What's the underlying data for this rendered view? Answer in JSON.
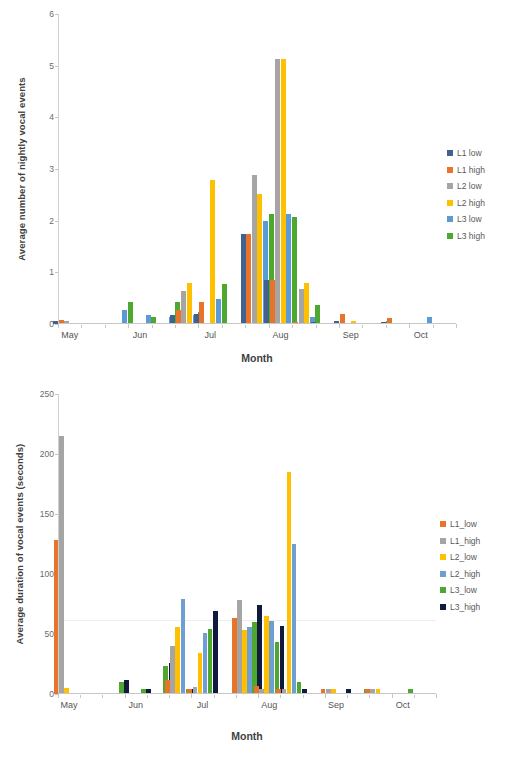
{
  "chart_data": [
    {
      "id": "chart1",
      "type": "bar",
      "title": "",
      "xlabel": "Month",
      "ylabel": "Average number of nightly vocal events",
      "ylim": [
        0,
        6
      ],
      "yticks": [
        0,
        1,
        2,
        3,
        4,
        5,
        6
      ],
      "grid": false,
      "legend_position": "right",
      "month_labels": [
        "May",
        "Jun",
        "Jul",
        "Aug",
        "Sep",
        "Oct"
      ],
      "month_label_slots": [
        0,
        3,
        6,
        9,
        12,
        15
      ],
      "categories": [
        "1",
        "2",
        "3",
        "4",
        "5",
        "6",
        "7",
        "8",
        "9",
        "10",
        "11",
        "12",
        "13",
        "14",
        "15",
        "16",
        "17"
      ],
      "series": [
        {
          "name": "L1 low",
          "color": "#41618f",
          "values": [
            0.06,
            0,
            0,
            0,
            0,
            0.17,
            0.2,
            0,
            1.75,
            0.85,
            0,
            0.04,
            0.06,
            0,
            0.04,
            0,
            0
          ]
        },
        {
          "name": "L1 high",
          "color": "#e8742c",
          "values": [
            0.08,
            0,
            0,
            0,
            0,
            0.27,
            0.42,
            0,
            1.75,
            0.85,
            0.04,
            0,
            0.2,
            0,
            0.12,
            0,
            0
          ]
        },
        {
          "name": "L2 low",
          "color": "#a5a5a5",
          "values": [
            0.06,
            0,
            0,
            0,
            0,
            0.63,
            0,
            0,
            2.88,
            5.13,
            0.67,
            0,
            0,
            0,
            0,
            0,
            0
          ]
        },
        {
          "name": "L2 high",
          "color": "#ffc000",
          "values": [
            0,
            0,
            0,
            0,
            0,
            0.8,
            2.79,
            0,
            2.52,
            5.13,
            0.79,
            0,
            0.05,
            0,
            0,
            0,
            0
          ]
        },
        {
          "name": "L3 low",
          "color": "#5b9bd5",
          "values": [
            0,
            0,
            0.28,
            0.18,
            0.14,
            0.17,
            0.49,
            0,
            1.99,
            2.13,
            0.13,
            0,
            0,
            0,
            0,
            0.13,
            0
          ]
        },
        {
          "name": "L3 high",
          "color": "#4ea72e",
          "values": [
            0,
            0,
            0.42,
            0.13,
            0.42,
            0.23,
            0.77,
            0,
            2.12,
            2.07,
            0.36,
            0,
            0,
            0.05,
            0,
            0,
            0
          ]
        }
      ]
    },
    {
      "id": "chart2",
      "type": "bar",
      "title": "",
      "xlabel": "Month",
      "ylabel": "Average duration of vocal events (seconds)",
      "ylim": [
        0,
        250
      ],
      "yticks": [
        0,
        50,
        100,
        150,
        200,
        250
      ],
      "grid": true,
      "gridlines": [
        62
      ],
      "legend_position": "right",
      "month_labels": [
        "May",
        "Jun",
        "Jul",
        "Aug",
        "Sep",
        "Oct"
      ],
      "month_label_slots": [
        0,
        3,
        6,
        9,
        12,
        15
      ],
      "categories": [
        "1",
        "2",
        "3",
        "4",
        "5",
        "6",
        "7",
        "8",
        "9",
        "10",
        "11",
        "12",
        "13",
        "14",
        "15",
        "16",
        "17"
      ],
      "series": [
        {
          "name": "L1_low",
          "color": "#e8742c",
          "values": [
            128,
            0,
            0,
            0,
            0,
            12,
            4,
            0,
            63,
            7,
            4,
            0,
            4,
            0,
            4,
            0,
            0
          ]
        },
        {
          "name": "L1_high",
          "color": "#a5a5a5",
          "values": [
            215,
            0,
            0,
            0,
            0,
            40,
            6,
            0,
            78,
            4,
            4,
            0,
            4,
            0,
            4,
            0,
            0
          ]
        },
        {
          "name": "L2_low",
          "color": "#ffc000",
          "values": [
            5,
            0,
            0,
            0,
            0,
            56,
            34,
            0,
            53,
            65,
            185,
            0,
            4,
            0,
            4,
            0,
            0
          ]
        },
        {
          "name": "L2_high",
          "color": "#6e9fd3",
          "values": [
            0,
            0,
            0,
            0,
            0,
            79,
            51,
            0,
            56,
            61,
            125,
            0,
            0,
            0,
            0,
            0,
            0
          ]
        },
        {
          "name": "L3_low",
          "color": "#4ea72e",
          "values": [
            0,
            0,
            10,
            4,
            23,
            4,
            54,
            0,
            60,
            43,
            10,
            0,
            0,
            4,
            0,
            4,
            0
          ]
        },
        {
          "name": "L3_high",
          "color": "#101a3c",
          "values": [
            0,
            0,
            12,
            4,
            26,
            4,
            69,
            0,
            74,
            57,
            4,
            0,
            4,
            0,
            0,
            0,
            0
          ]
        }
      ]
    }
  ]
}
